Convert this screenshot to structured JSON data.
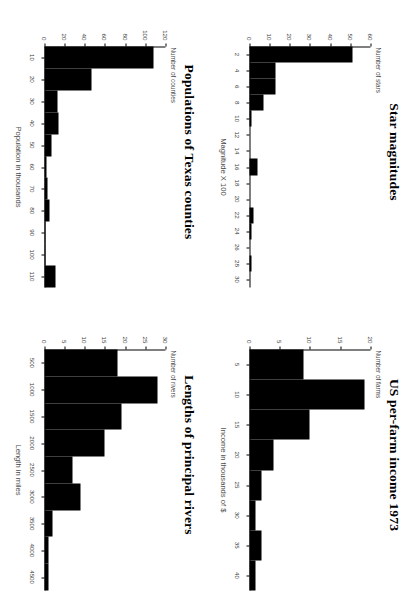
{
  "page": {
    "layout": "2x2-grid-of-histograms",
    "background": "#ffffff",
    "bar_color": "#000000",
    "axis_color": "#000000",
    "rotation_degrees": 90
  },
  "chart_data": [
    {
      "panel": "top-left",
      "type": "bar",
      "title": "Populations of Texas counties",
      "xlabel": "Population in thousands",
      "ylabel": "Number of counties",
      "categories": [
        "10",
        "20",
        "30",
        "40",
        "50",
        "60",
        "70",
        "80",
        "90",
        "100",
        "110"
      ],
      "values": [
        108,
        47,
        13,
        14,
        7,
        2,
        3,
        5,
        1,
        1,
        11
      ],
      "xticks": [
        10,
        20,
        30,
        40,
        50,
        60,
        70,
        80,
        90,
        100,
        110
      ],
      "yticks": [
        0,
        20,
        40,
        60,
        80,
        100,
        120
      ],
      "ylim": [
        0,
        120
      ],
      "grid": false,
      "legend": false
    },
    {
      "panel": "top-right",
      "type": "bar",
      "title": "Star magnitudes",
      "xlabel": "Magnitude X 100",
      "ylabel": "Number of stars",
      "categories": [
        "2",
        "4",
        "6",
        "8",
        "10",
        "12",
        "14",
        "16",
        "18",
        "20",
        "22",
        "24",
        "26",
        "28",
        "30"
      ],
      "values": [
        51,
        13,
        13,
        7,
        1,
        0,
        0,
        4,
        0,
        0,
        2,
        1,
        0,
        1,
        0
      ],
      "xticks": [
        2,
        4,
        6,
        8,
        10,
        12,
        14,
        16,
        18,
        20,
        22,
        24,
        26,
        28,
        30
      ],
      "yticks": [
        0,
        10,
        20,
        30,
        40,
        50,
        60
      ],
      "ylim": [
        0,
        60
      ],
      "grid": false,
      "legend": false
    },
    {
      "panel": "bottom-left",
      "type": "bar",
      "title": "Lengths of principal rivers",
      "xlabel": "Length in miles",
      "ylabel": "Number of rivers",
      "categories": [
        "500",
        "1000",
        "1500",
        "2000",
        "2500",
        "3000",
        "3500",
        "4000",
        "4500"
      ],
      "values": [
        18,
        28,
        19,
        15,
        7,
        9,
        2,
        1,
        1
      ],
      "xticks": [
        500,
        1000,
        1500,
        2000,
        2500,
        3000,
        3500,
        4000,
        4500
      ],
      "yticks": [
        0,
        5,
        10,
        15,
        20,
        25,
        30
      ],
      "ylim": [
        0,
        30
      ],
      "grid": false,
      "legend": false
    },
    {
      "panel": "bottom-right",
      "type": "bar",
      "title": "US per-farm income  1973",
      "xlabel": "Income in thousands of $",
      "ylabel": "Number of farms",
      "categories": [
        "5",
        "10",
        "15",
        "20",
        "25",
        "30",
        "35",
        "40"
      ],
      "values": [
        9,
        19,
        10,
        4,
        2,
        1,
        2,
        1
      ],
      "xticks": [
        5,
        10,
        15,
        20,
        25,
        30,
        35,
        40
      ],
      "yticks": [
        0,
        5,
        10,
        15,
        20
      ],
      "ylim": [
        0,
        20
      ],
      "grid": false,
      "legend": false
    }
  ]
}
